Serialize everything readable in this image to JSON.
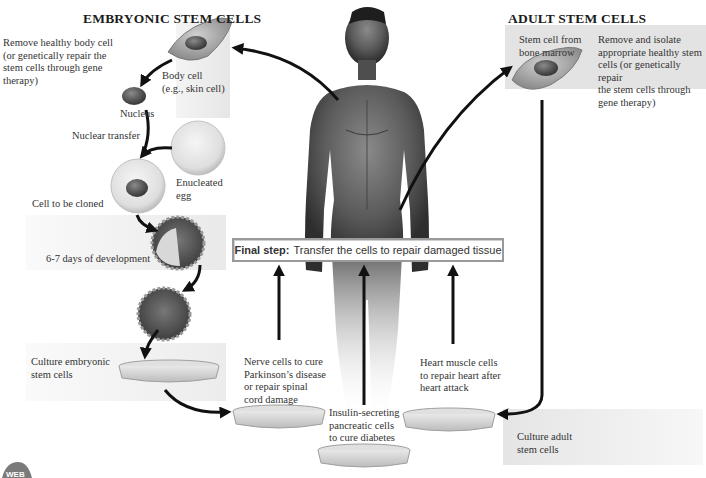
{
  "embryonic": {
    "heading": "EMBRYONIC STEM CELLS",
    "remove_body_cell": [
      "Remove healthy body cell",
      "(or genetically repair the",
      "stem cells through gene",
      "therapy)"
    ],
    "body_cell": [
      "Body cell",
      "(e.g., skin cell)"
    ],
    "nucleus": "Nucleus",
    "nuclear_transfer": "Nuclear transfer",
    "enucleated_egg": [
      "Enucleated",
      "egg"
    ],
    "cell_to_be_cloned": "Cell to be cloned",
    "development": "6-7 days of development",
    "culture": [
      "Culture embryonic",
      "stem cells"
    ]
  },
  "adult": {
    "heading": "ADULT STEM CELLS",
    "stem_cell_source": [
      "Stem cell from",
      "bone marrow"
    ],
    "remove_isolate": [
      "Remove and isolate",
      "appropriate healthy stem",
      "cells (or genetically repair",
      "the stem cells through",
      "gene therapy)"
    ],
    "culture": [
      "Culture adult",
      "stem cells"
    ]
  },
  "final_step": {
    "label": "Final step:",
    "text": "Transfer the cells to repair damaged tissue"
  },
  "outcomes": {
    "nerve": [
      "Nerve cells to cure",
      "Parkinson’s disease",
      "or repair spinal",
      "cord damage"
    ],
    "insulin": [
      "Insulin-secreting",
      "pancreatic cells",
      "to cure diabetes"
    ],
    "heart": [
      "Heart muscle cells",
      "to repair heart after",
      "heart attack"
    ]
  },
  "logo": {
    "text": "WEB"
  },
  "colors": {
    "panel_gray": "#ececec",
    "adult_panel": "#e2e2e2",
    "arrow": "#111111",
    "box_border": "#9a9a9a"
  }
}
